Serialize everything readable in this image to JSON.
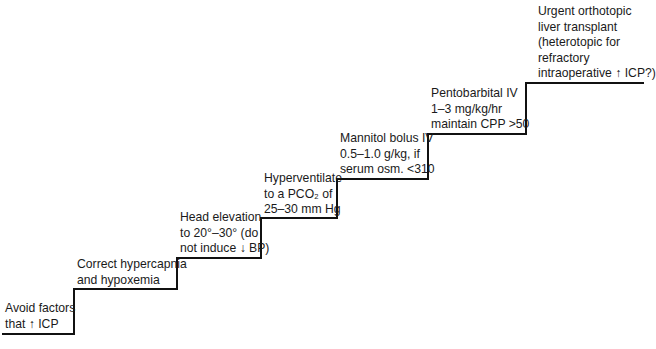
{
  "diagram": {
    "type": "staircase",
    "steps": [
      {
        "id": 1,
        "lines": [
          "Avoid factors",
          "that ↑ ICP"
        ]
      },
      {
        "id": 2,
        "lines": [
          "Correct hypercapnia",
          "and  hypoxemia"
        ]
      },
      {
        "id": 3,
        "lines": [
          "Head elevation",
          "to 20°–30° (do",
          "not induce ↓ BP)"
        ]
      },
      {
        "id": 4,
        "lines": [
          "Hyperventilate",
          "to a PCO₂ of",
          "25–30 mm Hg"
        ]
      },
      {
        "id": 5,
        "lines": [
          "Mannitol bolus IV",
          "0.5–1.0 g/kg, if",
          "serum osm. <310"
        ]
      },
      {
        "id": 6,
        "lines": [
          "Pentobarbital IV",
          "1–3 mg/kg/hr",
          "maintain CPP >50"
        ]
      },
      {
        "id": 7,
        "lines": [
          "Urgent orthotopic",
          "liver transplant",
          "(heterotopic for",
          "refractory",
          "intraoperative ↑ ICP?)"
        ]
      }
    ],
    "line_color": "#111111"
  }
}
